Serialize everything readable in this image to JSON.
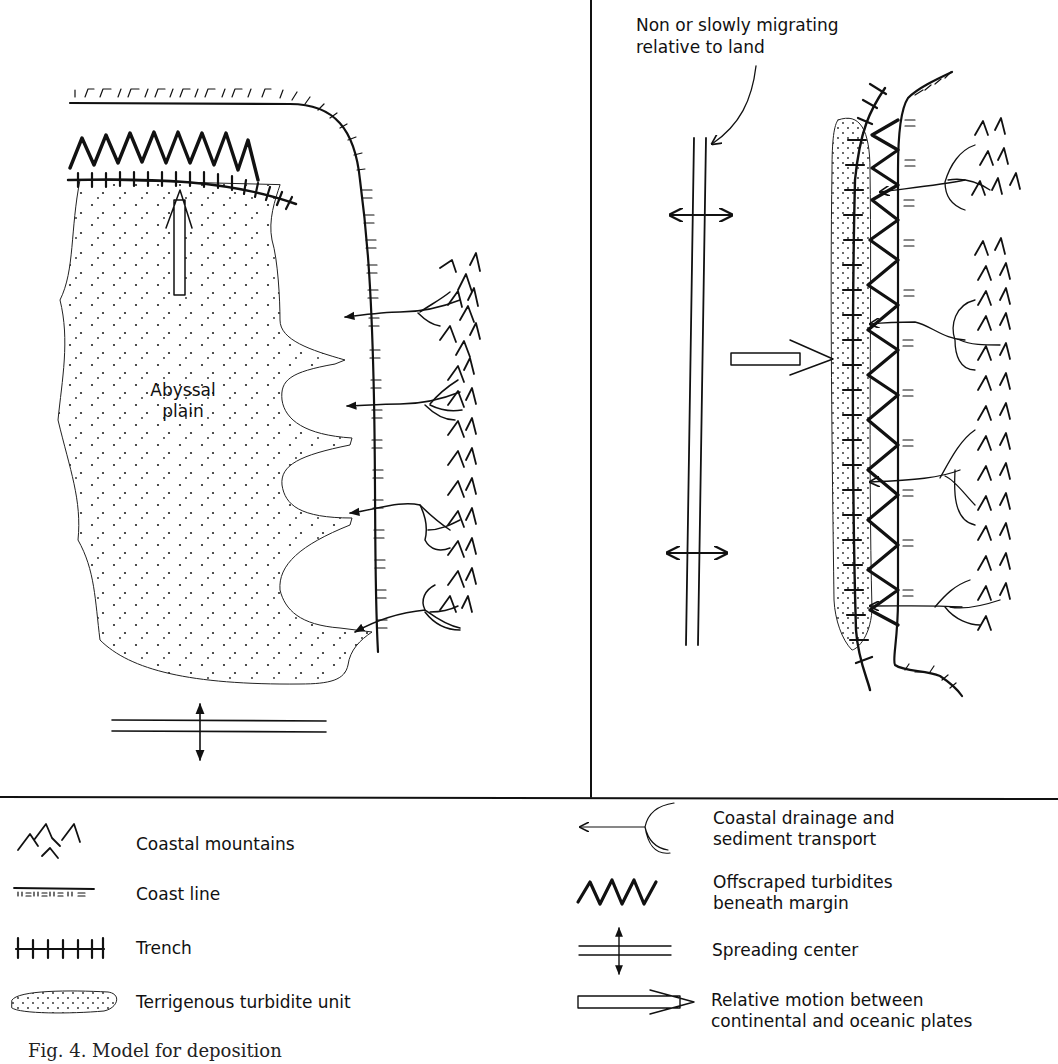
{
  "figure": {
    "left_panel": {
      "label_abyssal": "Abyssal",
      "label_plain": "plain"
    },
    "right_panel": {
      "annotation_line1": "Non or slowly migrating",
      "annotation_line2": "relative to land"
    },
    "legend": {
      "left": [
        {
          "icon": "coastal-mountains-icon",
          "label": "Coastal mountains"
        },
        {
          "icon": "coast-line-icon",
          "label": "Coast line"
        },
        {
          "icon": "trench-icon",
          "label": "Trench"
        },
        {
          "icon": "turbidite-unit-icon",
          "label": "Terrigenous turbidite unit"
        }
      ],
      "right": [
        {
          "icon": "drainage-arrow-icon",
          "line1": "Coastal drainage and",
          "line2": "sediment transport"
        },
        {
          "icon": "offscraped-zigzag-icon",
          "line1": "Offscraped turbidites",
          "line2": "beneath margin"
        },
        {
          "icon": "spreading-center-icon",
          "line1": "Spreading center",
          "line2": ""
        },
        {
          "icon": "plate-motion-arrow-icon",
          "line1": "Relative motion between",
          "line2": "continental and oceanic plates"
        }
      ]
    },
    "caption": "Fig. 4. Model for deposition"
  },
  "colors": {
    "ink": "#111111",
    "background": "#ffffff"
  }
}
